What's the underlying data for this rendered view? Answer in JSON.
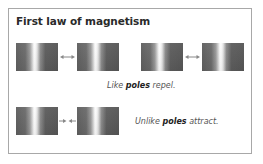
{
  "diagram": {
    "title": "First law of magnetism",
    "rows": [
      {
        "name": "like-poles",
        "caption": {
          "prefix": "Like ",
          "emphasis": "poles",
          "suffix": " repel."
        },
        "pairs": [
          {
            "arrow": "double-headed-arrow",
            "relation": "repel"
          },
          {
            "arrow": "double-headed-arrow",
            "relation": "repel"
          }
        ]
      },
      {
        "name": "unlike-poles",
        "caption": {
          "prefix": "Unlike ",
          "emphasis": "poles",
          "suffix": " attract."
        },
        "pairs": [
          {
            "arrow": "inward-arrows",
            "relation": "attract"
          }
        ]
      }
    ],
    "colors": {
      "frame_border": "#a8a8a8",
      "magnet_dark": "#5e5e5e",
      "magnet_highlight": "#ffffff",
      "arrow": "#888888",
      "title_text": "#2a2a2a",
      "caption_text": "#555555"
    }
  }
}
